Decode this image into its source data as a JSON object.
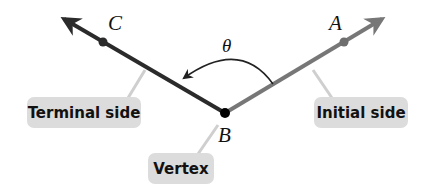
{
  "diagram": {
    "type": "angle",
    "points": {
      "A": "A",
      "B": "B",
      "C": "C"
    },
    "angle_label": "θ",
    "labels": {
      "terminal_side": "Terminal side",
      "initial_side": "Initial side",
      "vertex": "Vertex"
    },
    "colors": {
      "terminal_side": "#2b2b2b",
      "initial_side": "#777777",
      "label_box": "#dcdcdc",
      "vertex_point": "#000000"
    }
  }
}
